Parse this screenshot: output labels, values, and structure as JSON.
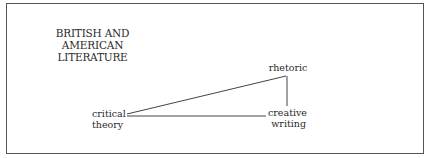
{
  "diagram": {
    "title_line1": "BRITISH AND AMERICAN",
    "title_line2": "LITERATURE",
    "nodes": {
      "rhetoric": {
        "label": "rhetoric"
      },
      "critical_theory": {
        "line1": "critical",
        "line2": "theory"
      },
      "creative_writing": {
        "line1": "creative",
        "line2": "writing"
      }
    },
    "edges": [
      {
        "from": "critical theory",
        "to": "rhetoric"
      },
      {
        "from": "critical theory",
        "to": "creative writing"
      },
      {
        "from": "rhetoric",
        "to": "creative writing"
      }
    ]
  }
}
